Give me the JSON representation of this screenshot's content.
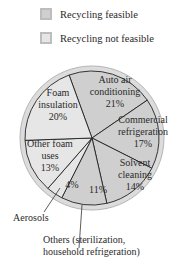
{
  "legend": {
    "items": [
      {
        "label": "Recycling feasible",
        "color": "#cfcfcf"
      },
      {
        "label": "Recycling not feasible",
        "color": "#e6e6e6"
      }
    ]
  },
  "slices": [
    {
      "label": "Auto air conditioning",
      "lines": [
        "Auto air",
        "conditioning",
        "21%"
      ],
      "value": 21,
      "recycling": "feasible"
    },
    {
      "label": "Commercial refrigeration",
      "lines": [
        "Commercial",
        "refrigeration",
        "17%"
      ],
      "value": 17,
      "recycling": "feasible"
    },
    {
      "label": "Solvent cleaning",
      "lines": [
        "Solvent",
        "cleaning",
        "14%"
      ],
      "value": 14,
      "recycling": "feasible"
    },
    {
      "label": "Others (sterilization, household refrigeration)",
      "lines": [
        "11%"
      ],
      "value": 11,
      "recycling": "feasible"
    },
    {
      "label": "Aerosols",
      "lines": [
        "4%"
      ],
      "value": 4,
      "recycling": "not feasible"
    },
    {
      "label": "Other foam uses",
      "lines": [
        "Other foam",
        "uses",
        "13%"
      ],
      "value": 13,
      "recycling": "not feasible"
    },
    {
      "label": "Foam insulation",
      "lines": [
        "Foam",
        "insulation",
        "20%"
      ],
      "value": 20,
      "recycling": "not feasible"
    }
  ],
  "external_labels": {
    "aerosols": "Aerosols",
    "others_line1": "Others (sterilization,",
    "others_line2": "household refrigeration)"
  },
  "chart_data": {
    "type": "pie",
    "title": "",
    "categories": [
      "Auto air conditioning",
      "Commercial refrigeration",
      "Solvent cleaning",
      "Others (sterilization, household refrigeration)",
      "Aerosols",
      "Other foam uses",
      "Foam insulation"
    ],
    "values": [
      21,
      17,
      14,
      11,
      4,
      13,
      20
    ],
    "units": "%",
    "legend": [
      "Recycling feasible",
      "Recycling not feasible"
    ],
    "legend_position": "top",
    "recycling_feasible": [
      "Auto air conditioning",
      "Commercial refrigeration",
      "Solvent cleaning",
      "Others (sterilization, household refrigeration)"
    ],
    "recycling_not_feasible": [
      "Foam insulation",
      "Other foam uses",
      "Aerosols"
    ]
  }
}
